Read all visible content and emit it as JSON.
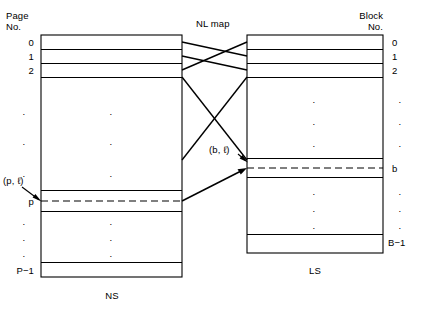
{
  "figure": {
    "title_left_header": "Page\nNo.",
    "title_right_header": "Block\nNo.",
    "map_label": "NL map",
    "left_structure_label": "NS",
    "right_structure_label": "LS",
    "left_pair_label": "(p, ℓ)",
    "right_pair_label": "(b, ℓ)"
  },
  "left_box": {
    "name": "NS",
    "row_labels": [
      "0",
      "1",
      "2",
      "p",
      "P−1"
    ],
    "vertical_ellipsis_upper": [
      "·",
      "·"
    ],
    "vertical_ellipsis_lower": [
      "·",
      "·",
      "·"
    ],
    "interior_ellipsis_upper": [
      "·",
      "·",
      "·"
    ],
    "interior_ellipsis_lower": [
      "·",
      "·",
      "·"
    ],
    "highlighted_row": "p",
    "highlight_style": "dashed"
  },
  "right_box": {
    "name": "LS",
    "row_labels": [
      "0",
      "1",
      "2",
      "b",
      "B−1"
    ],
    "vertical_ellipsis_upper": [
      "·",
      "·",
      "·"
    ],
    "vertical_ellipsis_lower": [
      "·",
      "·",
      "·"
    ],
    "interior_ellipsis_upper": [
      "·",
      "·",
      "·"
    ],
    "interior_ellipsis_lower": [
      "·",
      "·",
      "·"
    ],
    "highlighted_row": "b",
    "highlight_style": "dashed"
  },
  "colors": {
    "stroke": "#000000",
    "background": "#ffffff",
    "text": "#000000"
  }
}
